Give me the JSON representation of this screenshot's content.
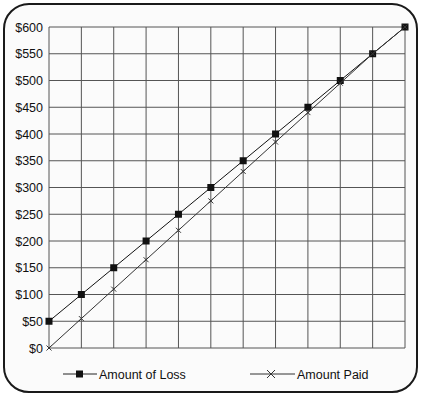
{
  "chart_data": {
    "type": "line",
    "title": "",
    "xlabel": "",
    "ylabel": "",
    "x": [
      0,
      1,
      2,
      3,
      4,
      5,
      6,
      7,
      8,
      9,
      10,
      11
    ],
    "xlim": [
      0,
      11
    ],
    "ylim": [
      0,
      600
    ],
    "y_ticks": [
      0,
      50,
      100,
      150,
      200,
      250,
      300,
      350,
      400,
      450,
      500,
      550,
      600
    ],
    "y_tick_labels": [
      "$0",
      "$50",
      "$100",
      "$150",
      "$200",
      "$250",
      "$300",
      "$350",
      "$400",
      "$450",
      "$500",
      "$550",
      "$600"
    ],
    "x_tick_labels": [],
    "grid": true,
    "legend_position": "bottom",
    "series": [
      {
        "name": "Amount of Loss",
        "marker": "square",
        "color": "#111111",
        "values": [
          50,
          100,
          150,
          200,
          250,
          300,
          350,
          400,
          450,
          500,
          550,
          600
        ]
      },
      {
        "name": "Amount Paid",
        "marker": "x",
        "color": "#333333",
        "values": [
          0,
          55,
          110,
          165,
          220,
          275,
          330,
          385,
          440,
          495,
          550,
          600
        ]
      }
    ]
  }
}
